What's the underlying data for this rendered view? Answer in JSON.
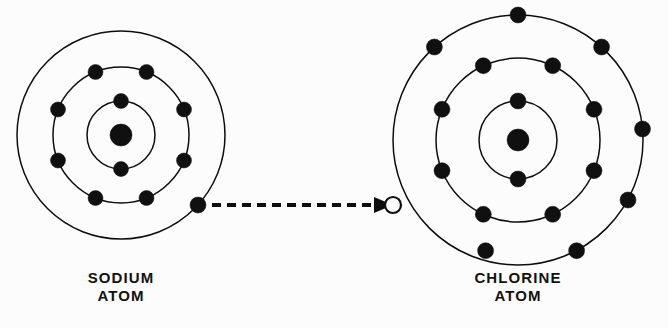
{
  "figure": {
    "background_color": "#fcfcfc",
    "ink_color": "#101010",
    "width": 668,
    "height": 328
  },
  "atoms": [
    {
      "id": "sodium",
      "caption_line1": "SODIUM",
      "caption_line2": "ATOM",
      "caption_x": 121,
      "caption_y1": 283,
      "caption_y2": 301,
      "center_x": 121,
      "center_y": 135,
      "nucleus_radius": 11,
      "shells": [
        {
          "name": "inner-shell",
          "radius": 34,
          "electron_count": 2,
          "electron_angles": [
            -90,
            90
          ]
        },
        {
          "name": "middle-shell",
          "radius": 68,
          "electron_count": 8,
          "electron_angles": [
            -112,
            -68,
            -22,
            22,
            68,
            112,
            158,
            202
          ]
        },
        {
          "name": "outer-shell",
          "radius": 104,
          "electron_count": 1,
          "electron_angles": [
            42
          ]
        }
      ],
      "electron_radius": 7.5
    },
    {
      "id": "chlorine",
      "caption_line1": "CHLORINE",
      "caption_line2": "ATOM",
      "caption_x": 518,
      "caption_y1": 283,
      "caption_y2": 301,
      "center_x": 518,
      "center_y": 140,
      "nucleus_radius": 11,
      "shells": [
        {
          "name": "inner-shell",
          "radius": 39,
          "electron_count": 2,
          "electron_angles": [
            -90,
            90
          ]
        },
        {
          "name": "middle-shell",
          "radius": 82,
          "electron_count": 8,
          "electron_angles": [
            -115,
            -65,
            -22,
            22,
            65,
            115,
            158,
            202
          ]
        },
        {
          "name": "outer-shell",
          "radius": 125,
          "electron_count": 7,
          "electron_angles": [
            -90,
            -132,
            -48,
            -5,
            28,
            62,
            105
          ],
          "vacancy_angle": 180,
          "vacancy_count": 1
        }
      ],
      "electron_radius": 8
    }
  ],
  "transfer": {
    "label": "electron-transfer-arrow",
    "start_x": 214,
    "start_y": 205,
    "end_x": 388,
    "end_y": 205,
    "dash_pattern": "9 6",
    "arrow_head_length": 16,
    "arrow_head_width": 14
  }
}
